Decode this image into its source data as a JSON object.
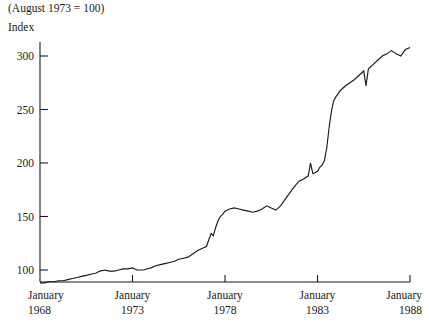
{
  "header": {
    "base_note": "(August 1973 = 100)",
    "axis_title": "Index"
  },
  "style": {
    "line_color": "#1a1a1a",
    "axis_color": "#1a1a1a",
    "background": "#ffffff",
    "text_color": "#1a1a1a"
  },
  "chart_data": {
    "type": "line",
    "title": "",
    "subtitle": "(August 1973 = 100)",
    "xlabel": "",
    "ylabel": "Index",
    "grid": false,
    "legend": false,
    "legend_position": "none",
    "xlim": [
      1968.0,
      1988.0
    ],
    "ylim": [
      85,
      315
    ],
    "yticks": [
      100,
      150,
      200,
      250,
      300
    ],
    "ytick_labels": [
      "100",
      "150",
      "200",
      "250",
      "300"
    ],
    "xticks": [
      1968,
      1973,
      1978,
      1983,
      1988
    ],
    "xtick_labels": [
      [
        "January",
        "1968"
      ],
      [
        "January",
        "1973"
      ],
      [
        "January",
        "1978"
      ],
      [
        "January",
        "1983"
      ],
      [
        "January",
        "1988"
      ]
    ],
    "series": [
      {
        "name": "Index",
        "x": [
          1968.0,
          1968.25,
          1968.5,
          1968.75,
          1969.0,
          1969.25,
          1969.5,
          1969.75,
          1970.0,
          1970.25,
          1970.5,
          1970.75,
          1971.0,
          1971.25,
          1971.5,
          1971.75,
          1972.0,
          1972.25,
          1972.5,
          1972.75,
          1973.0,
          1973.25,
          1973.5,
          1973.62,
          1973.75,
          1974.0,
          1974.25,
          1974.5,
          1974.75,
          1975.0,
          1975.25,
          1975.5,
          1975.75,
          1976.0,
          1976.25,
          1976.5,
          1976.75,
          1977.0,
          1977.12,
          1977.25,
          1977.37,
          1977.5,
          1977.62,
          1977.75,
          1977.87,
          1978.0,
          1978.25,
          1978.5,
          1978.75,
          1979.0,
          1979.25,
          1979.5,
          1979.75,
          1980.0,
          1980.25,
          1980.5,
          1980.75,
          1981.0,
          1981.25,
          1981.5,
          1981.75,
          1982.0,
          1982.25,
          1982.5,
          1982.62,
          1982.75,
          1983.0,
          1983.12,
          1983.25,
          1983.37,
          1983.5,
          1983.62,
          1983.75,
          1983.87,
          1984.0,
          1984.25,
          1984.5,
          1984.75,
          1985.0,
          1985.25,
          1985.5,
          1985.62,
          1985.75,
          1986.0,
          1986.25,
          1986.5,
          1986.75,
          1987.0,
          1987.25,
          1987.5,
          1987.75,
          1988.0
        ],
        "y": [
          88,
          88,
          89,
          89,
          90,
          90,
          91,
          92,
          93,
          94,
          95,
          96,
          97,
          99,
          100,
          99,
          99,
          100,
          101,
          101,
          102,
          100,
          100,
          100,
          101,
          102,
          104,
          105,
          106,
          107,
          108,
          110,
          111,
          112,
          115,
          118,
          120,
          122,
          128,
          134,
          132,
          140,
          146,
          150,
          152,
          155,
          157,
          158,
          157,
          156,
          155,
          154,
          155,
          157,
          160,
          158,
          156,
          160,
          166,
          172,
          178,
          183,
          185,
          188,
          200,
          190,
          192,
          196,
          198,
          202,
          214,
          232,
          248,
          258,
          262,
          268,
          272,
          275,
          278,
          282,
          286,
          272,
          288,
          292,
          296,
          300,
          302,
          305,
          302,
          300,
          306,
          308
        ]
      }
    ],
    "annotations": [
      {
        "text": "(August 1973 = 100)",
        "position": "top-left"
      },
      {
        "text": "Index",
        "position": "y-axis-top"
      }
    ]
  }
}
